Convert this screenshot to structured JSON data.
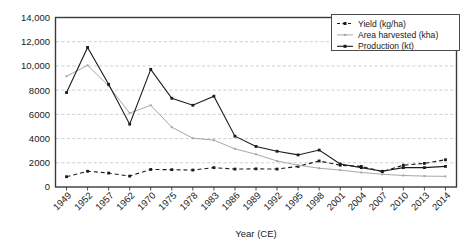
{
  "chart_data": {
    "type": "line",
    "title": "",
    "xlabel": "Year (CE)",
    "ylabel": "",
    "grid": "horizontal",
    "legend_position": "top-right",
    "categories": [
      "1949",
      "1952",
      "1957",
      "1962",
      "1970",
      "1975",
      "1978",
      "1983",
      "1986",
      "1989",
      "1992",
      "1995",
      "1998",
      "2001",
      "2004",
      "2007",
      "2010",
      "2013",
      "2014"
    ],
    "ylim": [
      0,
      14000
    ],
    "yticks": [
      0,
      2000,
      4000,
      6000,
      8000,
      10000,
      12000,
      14000
    ],
    "ytick_labels": [
      "0",
      "2000",
      "4000",
      "6000",
      "8000",
      "10,000",
      "12,000",
      "14,000"
    ],
    "series": [
      {
        "name": "Yield (kg/ha)",
        "color": "#1a1a1a",
        "marker": "square",
        "dash": "4 3",
        "values": [
          850,
          1300,
          1150,
          900,
          1450,
          1430,
          1400,
          1600,
          1480,
          1500,
          1480,
          1700,
          2150,
          1800,
          1700,
          1280,
          1800,
          1950,
          2250
        ]
      },
      {
        "name": "Area harvested (kha)",
        "color": "#a8a8a8",
        "marker": "square",
        "dash": "none",
        "values": [
          9150,
          10050,
          8350,
          6100,
          6750,
          4940,
          4030,
          3870,
          3150,
          2700,
          2150,
          1800,
          1550,
          1400,
          1200,
          1050,
          950,
          900,
          880
        ]
      },
      {
        "name": "Production (kt)",
        "color": "#1a1a1a",
        "marker": "square",
        "dash": "none",
        "values": [
          7800,
          11530,
          8480,
          5190,
          9720,
          7330,
          6750,
          7500,
          4200,
          3350,
          2950,
          2650,
          3050,
          1900,
          1600,
          1300,
          1600,
          1600,
          1700
        ]
      }
    ]
  },
  "legend": {
    "entries": [
      {
        "label": "Yield (kg/ha)"
      },
      {
        "label": "Area harvested (kha)"
      },
      {
        "label": "Production (kt)"
      }
    ]
  },
  "axes": {
    "x_title": "Year (CE)"
  }
}
